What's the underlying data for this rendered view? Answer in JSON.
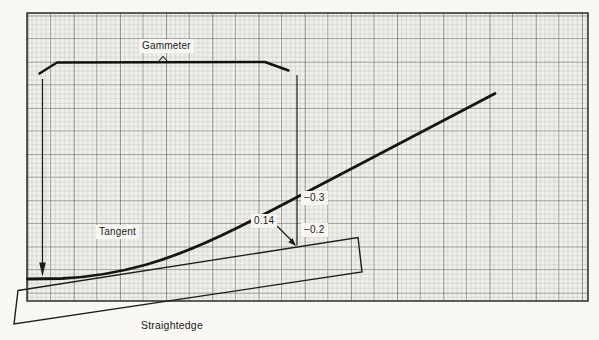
{
  "figure": {
    "labels": {
      "gammeter": "Gammeter",
      "tangent": "Tangent",
      "straightedge": "Straightedge"
    },
    "measurements": {
      "offset_at_tangent": "0.14",
      "reading_upper": "−0.3",
      "reading_lower": "−0.2"
    },
    "icons": {
      "down_arrow": "down-arrow-icon",
      "leader_arrow": "leader-arrow-icon",
      "label_caret": "caret-arrow-icon"
    },
    "colors": {
      "paper": "#f9f8f5",
      "grid_background": "#f1f0ec",
      "grid_minor": "#c6c5c1",
      "grid_medium": "#8f8e8a",
      "grid_major": "#4a4a47",
      "ink": "#1a1a1a"
    }
  }
}
